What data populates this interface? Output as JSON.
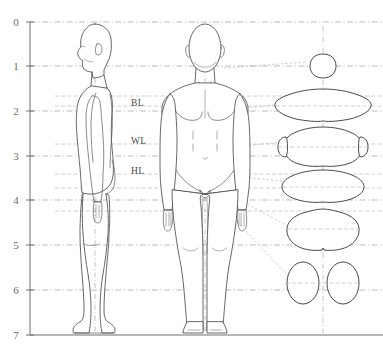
{
  "diagram": {
    "type": "anthropometric-proportion-diagram",
    "background_color": "#ffffff",
    "line_color": "#4d4d4d",
    "guide_color": "#8d8d8d",
    "leader_color": "#9e9e9e",
    "width": 383,
    "height": 357
  },
  "axis": {
    "name": "head-height-scale",
    "orientation": "vertical",
    "units": "head heights",
    "min": 0,
    "max": 7,
    "ticks": [
      {
        "label": "0",
        "value": 0,
        "y": 22
      },
      {
        "label": "1",
        "value": 1,
        "y": 66
      },
      {
        "label": "2",
        "value": 2,
        "y": 111
      },
      {
        "label": "3",
        "value": 3,
        "y": 156
      },
      {
        "label": "4",
        "value": 4,
        "y": 200
      },
      {
        "label": "5",
        "value": 5,
        "y": 245
      },
      {
        "label": "6",
        "value": 6,
        "y": 290
      },
      {
        "label": "7",
        "value": 7,
        "y": 335
      }
    ]
  },
  "level_labels": [
    {
      "id": "bust-line",
      "text": "BL",
      "x": 131,
      "y": 106,
      "meaning": "bust line"
    },
    {
      "id": "waist-line",
      "text": "WL",
      "x": 131,
      "y": 144,
      "meaning": "waist line"
    },
    {
      "id": "hip-line",
      "text": "HL",
      "x": 131,
      "y": 174,
      "meaning": "hip line"
    }
  ],
  "views": [
    {
      "id": "side-view",
      "label": "side view",
      "center_x": 95
    },
    {
      "id": "front-view",
      "label": "front view",
      "center_x": 205
    }
  ],
  "cross_sections": [
    {
      "id": "neck-section",
      "label": "neck",
      "cx": 323,
      "cy": 66,
      "rx": 13,
      "ry": 12
    },
    {
      "id": "bust-section",
      "label": "bust",
      "cx": 323,
      "cy": 104,
      "rx": 47,
      "ry": 17
    },
    {
      "id": "waist-section",
      "label": "waist",
      "cx": 323,
      "cy": 145,
      "rx": 39,
      "ry": 19
    },
    {
      "id": "hip-section",
      "label": "hip",
      "cx": 323,
      "cy": 185,
      "rx": 38,
      "ry": 16
    },
    {
      "id": "thigh-section",
      "label": "thigh",
      "cx": 323,
      "cy": 229,
      "rx": 38,
      "ry": 20
    },
    {
      "id": "leg-section",
      "label": "legs",
      "cx": 323,
      "cy": 283,
      "rx": 36,
      "ry": 20
    }
  ],
  "guide_levels": [
    {
      "value": 0,
      "y": 22
    },
    {
      "value": 1,
      "y": 66
    },
    {
      "value": 2,
      "y": 111
    },
    {
      "value": 3,
      "y": 156
    },
    {
      "value": 4,
      "y": 200
    },
    {
      "value": 5,
      "y": 245
    },
    {
      "value": 6,
      "y": 290
    },
    {
      "value": 7,
      "y": 335
    }
  ]
}
